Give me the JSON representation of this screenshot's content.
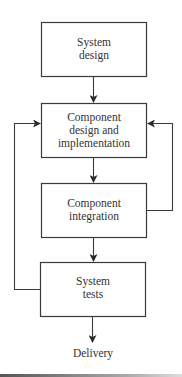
{
  "diagram": {
    "type": "flowchart",
    "nodes": [
      {
        "id": "system-design",
        "label_line1": "System",
        "label_line2": "design",
        "label_line3": ""
      },
      {
        "id": "component-design",
        "label_line1": "Component",
        "label_line2": "design and",
        "label_line3": "implementation"
      },
      {
        "id": "component-integration",
        "label_line1": "Component",
        "label_line2": "integration",
        "label_line3": ""
      },
      {
        "id": "system-tests",
        "label_line1": "System",
        "label_line2": "tests",
        "label_line3": ""
      }
    ],
    "terminal": {
      "label": "Delivery"
    },
    "edges": [
      {
        "from": "system-design",
        "to": "component-design"
      },
      {
        "from": "component-design",
        "to": "component-integration"
      },
      {
        "from": "component-integration",
        "to": "system-tests"
      },
      {
        "from": "system-tests",
        "to": "Delivery"
      },
      {
        "from": "component-integration",
        "to": "component-design",
        "kind": "feedback-right"
      },
      {
        "from": "system-tests",
        "to": "component-design",
        "kind": "feedback-left"
      }
    ],
    "colors": {
      "stroke": "#3a3a3a",
      "background": "#ffffff"
    }
  }
}
